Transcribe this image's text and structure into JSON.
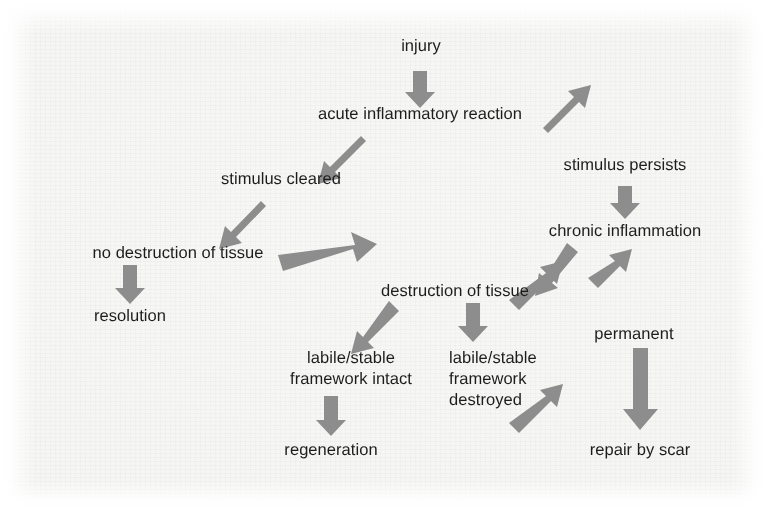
{
  "figure": {
    "kind": "flowchart",
    "background_color": "#f7f7f6",
    "text_color": "#1d1d1d",
    "arrow_color": "#8d8d8d",
    "width": 767,
    "height": 510
  },
  "nodes": [
    {
      "id": "injury",
      "label": "injury",
      "x": 421,
      "y": 47,
      "align": "center"
    },
    {
      "id": "acute",
      "label": "acute inflammatory reaction",
      "x": 420,
      "y": 115,
      "align": "center"
    },
    {
      "id": "cleared",
      "label": "stimulus cleared",
      "x": 281,
      "y": 180,
      "align": "center"
    },
    {
      "id": "persists",
      "label": "stimulus persists",
      "x": 625,
      "y": 166,
      "align": "center"
    },
    {
      "id": "chronic",
      "label": "chronic inflammation",
      "x": 625,
      "y": 228,
      "align": "center"
    },
    {
      "id": "no_destruction",
      "label": "no destruction of tissue",
      "x": 178,
      "y": 249,
      "align": "center"
    },
    {
      "id": "resolution",
      "label": "resolution",
      "x": 130,
      "y": 313,
      "align": "center"
    },
    {
      "id": "destruction",
      "label": "destruction of tissue",
      "x": 455,
      "y": 288,
      "align": "center"
    },
    {
      "id": "permanent",
      "label": "permanent",
      "x": 634,
      "y": 331,
      "align": "center"
    },
    {
      "id": "intact",
      "label": "labile/stable\nframework intact",
      "x": 351,
      "y": 353,
      "align": "center"
    },
    {
      "id": "destroyed",
      "label": "labile/stable\nframework\ndestroyed",
      "x": 449,
      "y": 353,
      "align": "left"
    },
    {
      "id": "regeneration",
      "label": "regeneration",
      "x": 331,
      "y": 446,
      "align": "center"
    },
    {
      "id": "repair",
      "label": "repair by scar",
      "x": 640,
      "y": 446,
      "align": "center"
    }
  ],
  "edges": [
    {
      "id": "injury-to-acute",
      "from": "injury",
      "to": "acute",
      "shape": "down",
      "style": "block-arrow"
    },
    {
      "id": "acute-to-cleared",
      "from": "acute",
      "to": "cleared",
      "shape": "down-left",
      "style": "block-arrow"
    },
    {
      "id": "acute-to-persists",
      "from": "acute",
      "to": "persists",
      "shape": "down-right",
      "style": "block-arrow"
    },
    {
      "id": "cleared-to-no-destruction",
      "from": "cleared",
      "to": "no_destruction",
      "shape": "down-left",
      "style": "block-arrow"
    },
    {
      "id": "persists-to-chronic",
      "from": "persists",
      "to": "chronic",
      "shape": "down",
      "style": "block-arrow"
    },
    {
      "id": "no-destruction-to-resolution",
      "from": "no_destruction",
      "to": "resolution",
      "shape": "down",
      "style": "block-arrow"
    },
    {
      "id": "no-destruction-to-destruction",
      "from": "no_destruction",
      "to": "destruction",
      "shape": "down-right-long",
      "style": "block-arrow"
    },
    {
      "id": "chronic-to-destruction",
      "from": "chronic",
      "to": "destruction",
      "shape": "down-left",
      "style": "block-arrow"
    },
    {
      "id": "chronic-to-permanent",
      "from": "chronic",
      "to": "permanent",
      "shape": "down-right",
      "style": "block-arrow"
    },
    {
      "id": "destruction-to-intact",
      "from": "destruction",
      "to": "intact",
      "shape": "down-left",
      "style": "block-arrow"
    },
    {
      "id": "destruction-to-destroyed",
      "from": "destruction",
      "to": "destroyed",
      "shape": "down",
      "style": "block-arrow"
    },
    {
      "id": "destruction-to-permanent",
      "from": "destruction",
      "to": "permanent",
      "shape": "down-right",
      "style": "block-arrow"
    },
    {
      "id": "intact-to-regeneration",
      "from": "intact",
      "to": "regeneration",
      "shape": "down",
      "style": "block-arrow"
    },
    {
      "id": "destroyed-to-repair",
      "from": "destroyed",
      "to": "repair",
      "shape": "down-right",
      "style": "block-arrow"
    },
    {
      "id": "permanent-to-repair",
      "from": "permanent",
      "to": "repair",
      "shape": "down-long",
      "style": "block-arrow"
    }
  ]
}
